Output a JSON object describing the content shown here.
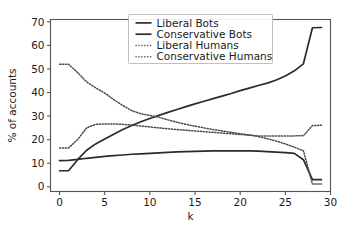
{
  "chart_data": {
    "type": "line",
    "title": "",
    "xlabel": "k",
    "ylabel": "% of accounts",
    "xlim": [
      -1,
      30
    ],
    "ylim": [
      -2,
      71
    ],
    "xticks": [
      "0",
      "5",
      "10",
      "15",
      "20",
      "25",
      "30"
    ],
    "xtick_values": [
      0,
      5,
      10,
      15,
      20,
      25,
      30
    ],
    "yticks": [
      "0",
      "10",
      "20",
      "30",
      "40",
      "50",
      "60",
      "70"
    ],
    "ytick_values": [
      0,
      10,
      20,
      30,
      40,
      50,
      60,
      70
    ],
    "grid": false,
    "legend_position": "upper center",
    "x": [
      0,
      1,
      2,
      3,
      4,
      5,
      6,
      7,
      8,
      9,
      10,
      11,
      12,
      13,
      14,
      15,
      16,
      17,
      18,
      19,
      20,
      21,
      22,
      23,
      24,
      25,
      26,
      27,
      28,
      29
    ],
    "series": [
      {
        "name": "Liberal Bots",
        "style": "solid",
        "color": "#2b2b2b",
        "values": [
          6.8,
          6.8,
          11.5,
          15.5,
          18.2,
          20.3,
          22.3,
          24.3,
          26.0,
          27.6,
          29.0,
          30.3,
          31.6,
          32.8,
          34.0,
          35.2,
          36.3,
          37.4,
          38.5,
          39.6,
          40.8,
          41.9,
          43.0,
          44.0,
          45.3,
          47.0,
          49.2,
          52.2,
          67.5,
          67.6
        ]
      },
      {
        "name": "Conservative Bots",
        "style": "solid",
        "color": "#2b2b2b",
        "values": [
          11.1,
          11.2,
          11.6,
          12.1,
          12.5,
          12.9,
          13.2,
          13.5,
          13.8,
          14.0,
          14.2,
          14.4,
          14.6,
          14.8,
          14.9,
          15.0,
          15.1,
          15.2,
          15.2,
          15.2,
          15.2,
          15.2,
          15.1,
          14.9,
          14.7,
          14.5,
          14.2,
          11.5,
          3.0,
          3.0
        ]
      },
      {
        "name": "Liberal Humans",
        "style": "dotted",
        "color": "#4a4a4a",
        "values": [
          52.0,
          52.0,
          48.5,
          44.5,
          42.0,
          39.8,
          37.0,
          34.5,
          32.3,
          31.0,
          30.3,
          29.5,
          28.4,
          27.4,
          26.5,
          25.7,
          25.0,
          24.3,
          23.7,
          23.1,
          22.5,
          22.0,
          21.3,
          20.4,
          19.4,
          18.2,
          16.8,
          15.3,
          1.2,
          1.2
        ]
      },
      {
        "name": "Conservative Humans",
        "style": "dotted",
        "color": "#4a4a4a",
        "values": [
          16.5,
          16.5,
          20.0,
          25.0,
          26.5,
          26.7,
          26.7,
          26.5,
          26.2,
          25.8,
          25.4,
          25.0,
          24.6,
          24.3,
          24.0,
          23.7,
          23.4,
          23.1,
          22.8,
          22.5,
          22.2,
          21.9,
          21.6,
          21.6,
          21.6,
          21.6,
          21.6,
          21.7,
          26.0,
          26.1
        ]
      }
    ]
  },
  "legend": {
    "items": [
      {
        "label": "Liberal Bots"
      },
      {
        "label": "Conservative Bots"
      },
      {
        "label": "Liberal Humans"
      },
      {
        "label": "Conservative Humans"
      }
    ]
  }
}
